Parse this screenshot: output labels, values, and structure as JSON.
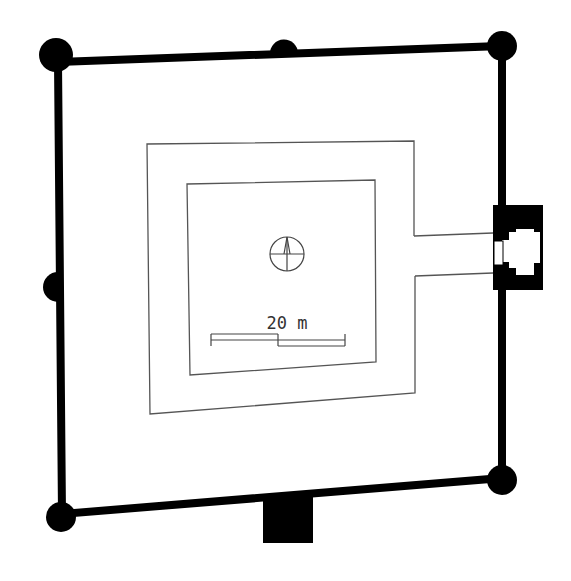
{
  "diagram": {
    "type": "architectural floor plan",
    "colors": {
      "background": "#ffffff",
      "wall": "#000000",
      "inner_line": "#555555",
      "annotation": "#333333"
    },
    "outer_wall": {
      "corners": [
        [
          58,
          62
        ],
        [
          502,
          46
        ],
        [
          502,
          478
        ],
        [
          62,
          514
        ]
      ],
      "thickness": 8,
      "corner_towers": [
        {
          "cx": 56,
          "cy": 55,
          "r": 17
        },
        {
          "cx": 502,
          "cy": 46,
          "r": 15
        },
        {
          "cx": 502,
          "cy": 480,
          "r": 15
        },
        {
          "cx": 61,
          "cy": 517,
          "r": 15
        }
      ],
      "mid_towers": [
        {
          "side": "top",
          "cx": 284,
          "cy": 53,
          "r": 14
        },
        {
          "side": "left",
          "cx": 57,
          "cy": 287,
          "r": 15
        }
      ]
    },
    "gate_tower": {
      "side": "right",
      "x": 493,
      "y": 205,
      "w": 50,
      "h": 85
    },
    "bottom_buttress": {
      "x": 263,
      "y": 495,
      "w": 50,
      "h": 48
    },
    "inner_enclosure": {
      "outer_rect": [
        [
          147,
          144
        ],
        [
          414,
          141
        ],
        [
          415,
          393
        ],
        [
          150,
          414
        ]
      ],
      "inner_rect": [
        [
          187,
          184
        ],
        [
          375,
          180
        ],
        [
          376,
          362
        ],
        [
          190,
          375
        ]
      ],
      "corridor_to_gate": {
        "top": [
          [
            414,
            236
          ],
          [
            493,
            233
          ]
        ],
        "bottom": [
          [
            414,
            276
          ],
          [
            493,
            273
          ]
        ]
      }
    },
    "north_arrow": {
      "cx": 287,
      "cy": 254,
      "r": 17,
      "label": "north-arrow"
    },
    "scale_bar": {
      "label": "20 m",
      "x_start": 211,
      "x_mid": 278,
      "x_end": 345,
      "y_top": 334,
      "y_mid": 340,
      "y_bottom": 346
    }
  }
}
